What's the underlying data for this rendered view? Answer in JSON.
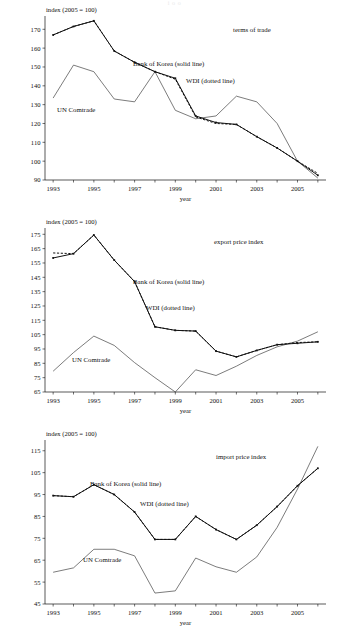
{
  "figure": {
    "header_fragment": "i  o               o",
    "axis_y_label": "index (2005 = 100)",
    "axis_x_label": "year",
    "series_labels": {
      "bok": "Bank of Korea (solid line)",
      "wdi": "WDI (dotted line)",
      "comtrade": "UN Comtrade"
    }
  },
  "chart_data": [
    {
      "type": "line",
      "title": "terms of trade",
      "xlabel": "year",
      "ylabel": "index (2005 = 100)",
      "xlim": [
        1992.6,
        2006.4
      ],
      "ylim": [
        90,
        176
      ],
      "yticks": [
        90,
        100,
        110,
        120,
        130,
        140,
        150,
        160,
        170
      ],
      "xticks": [
        1993,
        1994,
        1995,
        1996,
        1997,
        1998,
        1999,
        2000,
        2001,
        2002,
        2003,
        2004,
        2005,
        2006
      ],
      "xticklabels": [
        "1993",
        "",
        "1995",
        "",
        "1997",
        "",
        "1999",
        "",
        "2001",
        "",
        "2003",
        "",
        "2005",
        ""
      ],
      "grid": false,
      "legend": "inline-annotations",
      "x": [
        1993,
        1994,
        1995,
        1996,
        1997,
        1998,
        1999,
        2000,
        2001,
        2002,
        2003,
        2004,
        2005,
        2006
      ],
      "series": [
        {
          "name": "Bank of Korea (solid line)",
          "style": "solid",
          "values": [
            167.0,
            171.5,
            174.5,
            158.5,
            152.5,
            147.5,
            144.0,
            124.0,
            120.5,
            119.5,
            113.0,
            107.0,
            100.0,
            92.5
          ]
        },
        {
          "name": "WDI (dotted line)",
          "style": "dotted",
          "values": [
            167.0,
            171.5,
            174.5,
            158.5,
            152.5,
            147.5,
            143.5,
            123.5,
            120.0,
            119.5,
            113.0,
            107.0,
            100.0,
            93.5
          ]
        },
        {
          "name": "UN Comtrade",
          "style": "thin-solid",
          "values": [
            133.5,
            151.0,
            147.5,
            133.0,
            131.5,
            147.5,
            127.0,
            122.5,
            124.0,
            134.5,
            131.5,
            120.0,
            100.0,
            91.0
          ]
        }
      ]
    },
    {
      "type": "line",
      "title": "export price index",
      "xlabel": "year",
      "ylabel": "index (2005 = 100)",
      "xlim": [
        1992.6,
        2006.4
      ],
      "ylim": [
        65,
        178
      ],
      "yticks": [
        65,
        75,
        85,
        95,
        105,
        115,
        125,
        135,
        145,
        155,
        165,
        175
      ],
      "xticks": [
        1993,
        1994,
        1995,
        1996,
        1997,
        1998,
        1999,
        2000,
        2001,
        2002,
        2003,
        2004,
        2005,
        2006
      ],
      "xticklabels": [
        "1993",
        "",
        "1995",
        "",
        "1997",
        "",
        "1999",
        "",
        "2001",
        "",
        "2003",
        "",
        "2005",
        ""
      ],
      "grid": false,
      "legend": "inline-annotations",
      "x": [
        1993,
        1994,
        1995,
        1996,
        1997,
        1998,
        1999,
        2000,
        2001,
        2002,
        2003,
        2004,
        2005,
        2006
      ],
      "series": [
        {
          "name": "Bank of Korea (solid line)",
          "style": "solid",
          "values": [
            158.5,
            161.5,
            174.5,
            157.0,
            142.0,
            110.5,
            108.0,
            107.5,
            93.5,
            89.5,
            94.0,
            98.0,
            99.0,
            100.0
          ]
        },
        {
          "name": "WDI (dotted line)",
          "style": "dotted",
          "values": [
            162.0,
            161.5,
            174.5,
            157.0,
            142.0,
            110.5,
            108.0,
            107.5,
            93.5,
            89.5,
            94.0,
            98.0,
            99.5,
            100.0
          ]
        },
        {
          "name": "UN Comtrade",
          "style": "thin-solid",
          "values": [
            79.5,
            92.5,
            104.0,
            97.5,
            85.5,
            75.0,
            65.0,
            80.5,
            76.5,
            83.0,
            90.5,
            96.5,
            100.5,
            107.0
          ]
        }
      ]
    },
    {
      "type": "line",
      "title": "import price index",
      "xlabel": "year",
      "ylabel": "index (2005 = 100)",
      "xlim": [
        1992.6,
        2006.4
      ],
      "ylim": [
        45,
        119
      ],
      "yticks": [
        45,
        55,
        65,
        75,
        85,
        95,
        105,
        115
      ],
      "xticks": [
        1993,
        1994,
        1995,
        1996,
        1997,
        1998,
        1999,
        2000,
        2001,
        2002,
        2003,
        2004,
        2005,
        2006
      ],
      "xticklabels": [
        "1993",
        "",
        "1995",
        "",
        "1997",
        "",
        "1999",
        "",
        "2001",
        "",
        "2003",
        "",
        "2005",
        ""
      ],
      "grid": false,
      "legend": "inline-annotations",
      "x": [
        1993,
        1994,
        1995,
        1996,
        1997,
        1998,
        1999,
        2000,
        2001,
        2002,
        2003,
        2004,
        2005,
        2006
      ],
      "series": [
        {
          "name": "Bank of Korea (solid line)",
          "style": "solid",
          "values": [
            94.5,
            94.0,
            99.5,
            95.0,
            87.0,
            74.5,
            74.5,
            85.0,
            79.0,
            74.5,
            81.0,
            89.5,
            99.0,
            107.0
          ]
        },
        {
          "name": "WDI (dotted line)",
          "style": "dotted",
          "values": [
            94.5,
            94.0,
            99.5,
            95.0,
            87.0,
            74.5,
            74.5,
            85.0,
            79.0,
            74.5,
            81.0,
            89.5,
            99.0,
            107.0
          ]
        },
        {
          "name": "UN Comtrade",
          "style": "thin-solid",
          "values": [
            59.5,
            61.5,
            70.0,
            70.0,
            67.0,
            50.0,
            51.0,
            66.0,
            62.0,
            59.5,
            66.5,
            80.0,
            97.5,
            117.0
          ]
        }
      ]
    }
  ]
}
